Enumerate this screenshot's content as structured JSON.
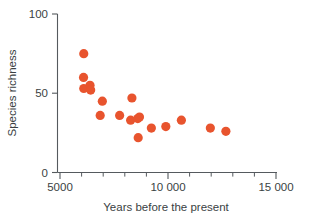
{
  "chart_data": {
    "type": "scatter",
    "title": "",
    "xlabel": "Years before the present",
    "ylabel": "Species richness",
    "xlim": [
      5000,
      15000
    ],
    "ylim": [
      0,
      100
    ],
    "grid": false,
    "legend": null,
    "marker_color": "#e8542e",
    "marker_size": 4.6,
    "xticks": [
      5000,
      10000,
      15000
    ],
    "xticklabels": [
      "5000",
      "10 000",
      "15 000"
    ],
    "xminorticks": [
      6000,
      7000,
      8000,
      9000,
      11000,
      12000,
      13000,
      14000
    ],
    "yticks": [
      0,
      50,
      100
    ],
    "yticklabels": [
      "0",
      "50",
      "100"
    ],
    "series": [
      {
        "name": "Species richness",
        "points": [
          {
            "x": 6100,
            "y": 75
          },
          {
            "x": 6090,
            "y": 60
          },
          {
            "x": 6100,
            "y": 53
          },
          {
            "x": 6390,
            "y": 55
          },
          {
            "x": 6420,
            "y": 52
          },
          {
            "x": 6960,
            "y": 45
          },
          {
            "x": 6860,
            "y": 36
          },
          {
            "x": 7760,
            "y": 36
          },
          {
            "x": 8330,
            "y": 47
          },
          {
            "x": 8270,
            "y": 33
          },
          {
            "x": 8600,
            "y": 34
          },
          {
            "x": 8680,
            "y": 35
          },
          {
            "x": 8620,
            "y": 22
          },
          {
            "x": 9230,
            "y": 28
          },
          {
            "x": 9900,
            "y": 29
          },
          {
            "x": 10620,
            "y": 33
          },
          {
            "x": 11960,
            "y": 28
          },
          {
            "x": 12680,
            "y": 26
          }
        ]
      }
    ]
  },
  "axis_text": {
    "y_label": "Species richness",
    "x_label": "Years before the present",
    "y_top": "100",
    "y_mid": "50",
    "y_bottom": "0",
    "x_left": "5000",
    "x_mid": "10 000",
    "x_right": "15 000"
  }
}
